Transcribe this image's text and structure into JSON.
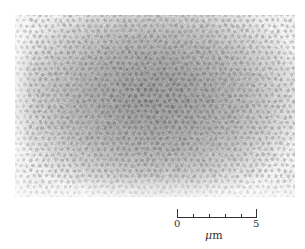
{
  "figure": {
    "type": "micrograph",
    "colors": {
      "background": "#ffffff",
      "center_gray": "#9c9c9c",
      "edge_gray": "#e6e6e6",
      "dot_dark": "#6e6e6e"
    }
  },
  "scale_bar": {
    "start_label": "0",
    "end_label": "5",
    "unit_symbol": "μ",
    "unit_suffix": "m",
    "tick_count": 6
  }
}
